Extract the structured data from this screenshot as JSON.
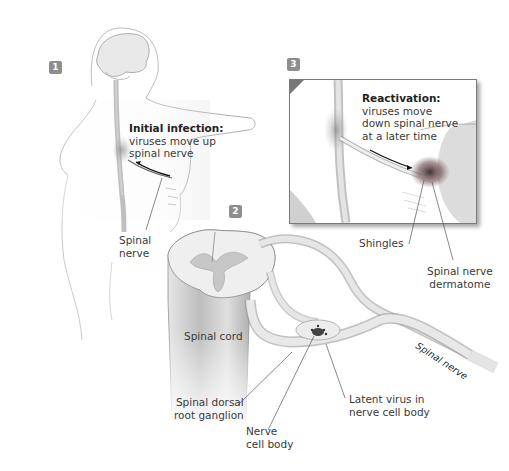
{
  "figure": {
    "colors": {
      "badge": "#8e8e8e",
      "text": "#3a3a3a",
      "line": "#555555",
      "rash": "#6a4a4a"
    }
  },
  "panels": [
    {
      "number": "1",
      "callout": {
        "heading": "Initial infection:",
        "lines": [
          "viruses move up",
          "spinal nerve"
        ]
      },
      "labels": [
        {
          "lines": [
            "Spinal",
            "nerve"
          ]
        }
      ]
    },
    {
      "number": "2",
      "labels": [
        {
          "name": "spinal-cord",
          "lines": [
            "Spinal cord"
          ]
        },
        {
          "name": "spinal-nerve-rotated",
          "lines": [
            "Spinal nerve"
          ]
        },
        {
          "name": "dorsal-root-ganglion",
          "lines": [
            "Spinal dorsal",
            "root ganglion"
          ]
        },
        {
          "name": "nerve-cell-body",
          "lines": [
            "Nerve",
            "cell body"
          ]
        },
        {
          "name": "latent-virus",
          "lines": [
            "Latent virus in",
            "nerve cell body"
          ]
        }
      ]
    },
    {
      "number": "3",
      "callout": {
        "heading": "Reactivation:",
        "lines": [
          "viruses move",
          "down spinal nerve",
          "at a later time"
        ]
      },
      "labels": [
        {
          "name": "shingles",
          "lines": [
            "Shingles"
          ]
        },
        {
          "name": "dermatome",
          "lines": [
            "Spinal nerve",
            "dermatome"
          ]
        }
      ]
    }
  ]
}
